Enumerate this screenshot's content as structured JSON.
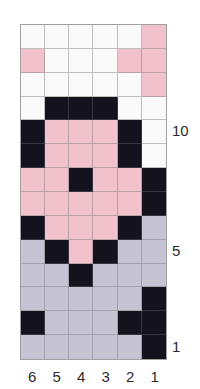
{
  "chart_data": {
    "type": "heatmap",
    "title": "",
    "xlabel": "",
    "ylabel": "",
    "grid": true,
    "legend_position": "none",
    "columns": 6,
    "rows": 14,
    "column_labels": [
      "6",
      "5",
      "4",
      "3",
      "2",
      "1"
    ],
    "row_labels_shown": [
      "10",
      "5",
      "1"
    ],
    "row_label_rows": [
      10,
      5,
      1
    ],
    "color_key": {
      "W": "#fbfafa",
      "P": "#f2c2cc",
      "L": "#c6c4d4",
      "K": "#14121c"
    },
    "color_names": {
      "W": "white",
      "P": "pink",
      "L": "lavender-grey",
      "K": "black"
    },
    "cells": [
      [
        "W",
        "W",
        "W",
        "W",
        "W",
        "P"
      ],
      [
        "P",
        "W",
        "W",
        "W",
        "P",
        "P"
      ],
      [
        "W",
        "W",
        "W",
        "W",
        "W",
        "P"
      ],
      [
        "W",
        "K",
        "K",
        "K",
        "W",
        "W"
      ],
      [
        "K",
        "P",
        "P",
        "P",
        "K",
        "W"
      ],
      [
        "K",
        "P",
        "P",
        "P",
        "K",
        "W"
      ],
      [
        "P",
        "P",
        "K",
        "P",
        "P",
        "K"
      ],
      [
        "P",
        "P",
        "P",
        "P",
        "P",
        "K"
      ],
      [
        "K",
        "P",
        "P",
        "P",
        "K",
        "L"
      ],
      [
        "L",
        "K",
        "P",
        "K",
        "L",
        "L"
      ],
      [
        "L",
        "L",
        "K",
        "L",
        "L",
        "L"
      ],
      [
        "L",
        "L",
        "L",
        "L",
        "L",
        "K"
      ],
      [
        "K",
        "L",
        "L",
        "L",
        "K",
        "K"
      ],
      [
        "L",
        "L",
        "L",
        "L",
        "L",
        "K"
      ]
    ]
  }
}
